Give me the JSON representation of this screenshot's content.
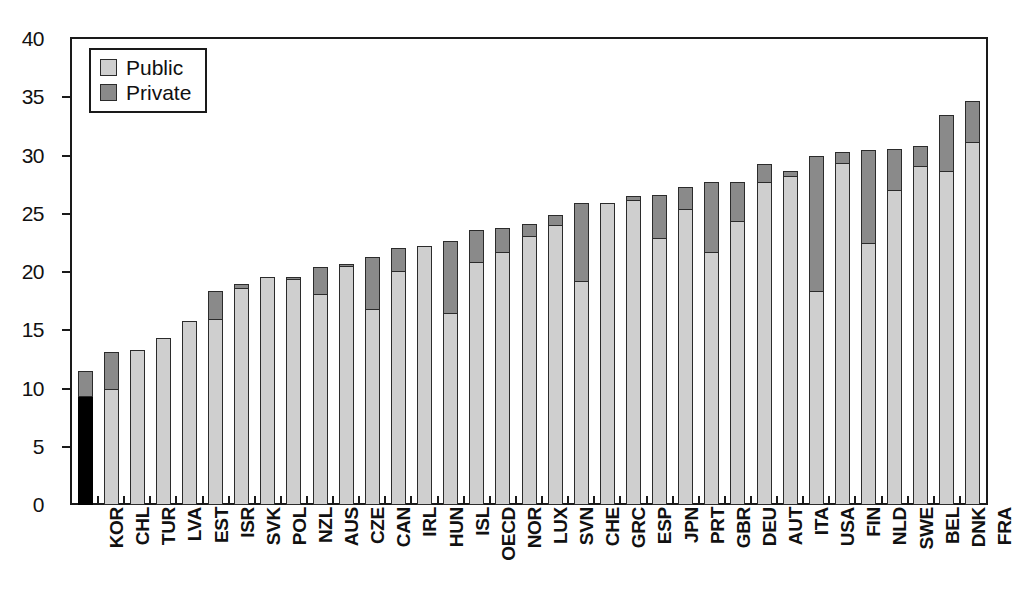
{
  "chart_data": {
    "type": "bar",
    "subtype": "stacked-bar",
    "title": "",
    "subtitle": "",
    "xlabel": "",
    "ylabel": "",
    "ylim": [
      0,
      40
    ],
    "ytick_step": 5,
    "ytick_labels": [
      "0",
      "5",
      "10",
      "15",
      "20",
      "25",
      "30",
      "35",
      "40"
    ],
    "grid": false,
    "legend_position": "top-left",
    "legend": [
      {
        "name": "Public",
        "color": "#cfcfcf"
      },
      {
        "name": "Private",
        "color": "#8a8a8a"
      }
    ],
    "highlight": {
      "category": "KOR",
      "color": "#000000"
    },
    "categories": [
      "KOR",
      "CHL",
      "TUR",
      "LVA",
      "EST",
      "ISR",
      "SVK",
      "POL",
      "NZL",
      "AUS",
      "CZE",
      "CAN",
      "IRL",
      "HUN",
      "ISL",
      "OECD",
      "NOR",
      "LUX",
      "SVN",
      "CHE",
      "GRC",
      "ESP",
      "JPN",
      "PRT",
      "GBR",
      "DEU",
      "AUT",
      "ITA",
      "USA",
      "FIN",
      "NLD",
      "SWE",
      "BEL",
      "DNK",
      "FRA"
    ],
    "series": [
      {
        "name": "Public",
        "color": "#cfcfcf",
        "values": [
          9.4,
          10.0,
          13.3,
          14.3,
          15.8,
          16.0,
          18.6,
          19.6,
          19.4,
          18.1,
          20.5,
          16.8,
          20.1,
          22.2,
          16.5,
          20.9,
          21.7,
          23.1,
          24.0,
          19.2,
          25.9,
          26.2,
          22.9,
          25.4,
          21.7,
          24.4,
          27.7,
          28.2,
          18.4,
          29.4,
          22.5,
          27.0,
          29.1,
          28.7,
          31.2
        ]
      },
      {
        "name": "Private",
        "color": "#8a8a8a",
        "values": [
          2.1,
          3.1,
          0.0,
          0.0,
          0.0,
          2.4,
          0.4,
          0.0,
          0.2,
          2.3,
          0.2,
          4.5,
          2.0,
          0.0,
          6.2,
          2.7,
          2.1,
          1.0,
          0.9,
          6.7,
          0.0,
          0.3,
          3.7,
          1.9,
          6.0,
          3.3,
          1.6,
          0.5,
          11.6,
          0.9,
          8.0,
          3.6,
          1.7,
          4.8,
          3.5
        ]
      }
    ],
    "totals": [
      11.5,
      13.1,
      13.3,
      14.3,
      15.8,
      18.4,
      19.0,
      19.6,
      19.6,
      20.4,
      20.7,
      21.3,
      22.1,
      22.2,
      22.7,
      23.6,
      23.8,
      24.1,
      24.9,
      25.9,
      25.9,
      26.5,
      26.6,
      27.3,
      27.7,
      27.7,
      29.3,
      28.7,
      30.0,
      30.3,
      30.5,
      30.6,
      30.8,
      33.5,
      34.7
    ]
  }
}
